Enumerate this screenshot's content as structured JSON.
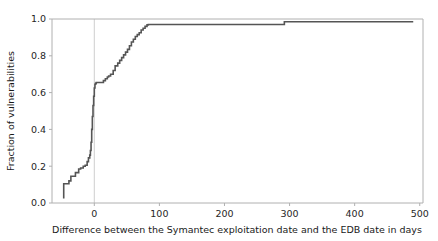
{
  "chart_data": {
    "type": "line",
    "title": "",
    "subtitle": "",
    "xlabel": "Difference between the Symantec exploitation date and the EDB date in days",
    "ylabel": "Fraction of vulnerabilities",
    "xlim": [
      -65,
      505
    ],
    "ylim": [
      0.0,
      1.0
    ],
    "xticks": [
      0,
      100,
      200,
      300,
      400,
      500
    ],
    "xtick_labels": [
      "0",
      "100",
      "200",
      "300",
      "400",
      "500"
    ],
    "yticks": [
      0.0,
      0.2,
      0.4,
      0.6,
      0.8,
      1.0
    ],
    "ytick_labels": [
      "0.0",
      "0.2",
      "0.4",
      "0.6",
      "0.8",
      "1.0"
    ],
    "grid": false,
    "legend": null,
    "drawstyle": "steps-post",
    "line_color": "#555555",
    "line_width": 1.6,
    "reference_line": {
      "orientation": "vertical",
      "x": 0,
      "color": "#c8c8c8",
      "width": 0.9
    },
    "series": [
      {
        "name": "Empirical CDF",
        "x": [
          -47,
          -47,
          -43,
          -39,
          -36,
          -33,
          -29,
          -24,
          -21,
          -17,
          -14,
          -11,
          -9,
          -7,
          -6,
          -5,
          -4,
          -3,
          -2,
          -1,
          0,
          1,
          2,
          3,
          4,
          6,
          10,
          14,
          17,
          20,
          22,
          25,
          29,
          32,
          36,
          39,
          42,
          45,
          48,
          51,
          54,
          57,
          60,
          63,
          66,
          69,
          72,
          75,
          78,
          81,
          83,
          292,
          490
        ],
        "y": [
          0.025,
          0.105,
          0.105,
          0.12,
          0.145,
          0.145,
          0.165,
          0.185,
          0.19,
          0.2,
          0.205,
          0.225,
          0.245,
          0.26,
          0.285,
          0.33,
          0.4,
          0.47,
          0.53,
          0.58,
          0.625,
          0.645,
          0.65,
          0.655,
          0.655,
          0.655,
          0.655,
          0.665,
          0.675,
          0.685,
          0.69,
          0.7,
          0.72,
          0.745,
          0.76,
          0.775,
          0.79,
          0.805,
          0.82,
          0.835,
          0.855,
          0.875,
          0.89,
          0.905,
          0.915,
          0.925,
          0.94,
          0.95,
          0.96,
          0.968,
          0.97,
          0.985,
          0.985
        ]
      }
    ]
  },
  "axes": {
    "spine_color": "#b0b0b0",
    "tick_color": "#b0b0b0"
  }
}
